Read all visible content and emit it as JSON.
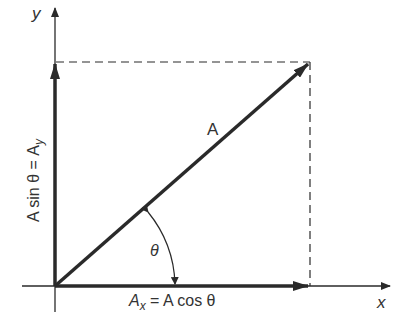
{
  "diagram": {
    "type": "vector-components",
    "colors": {
      "background": "#ffffff",
      "ink": "#2a2a2a",
      "text": "#333333"
    },
    "axes": {
      "x_label": "x",
      "y_label": "y"
    },
    "vector": {
      "label": "A"
    },
    "components": {
      "x_label_main": "A",
      "x_label_sub": "x",
      "x_label_rest": " = A cos θ",
      "y_label_main": "A sin θ = A",
      "y_label_sub": "y"
    },
    "angle": {
      "label": "θ"
    }
  }
}
